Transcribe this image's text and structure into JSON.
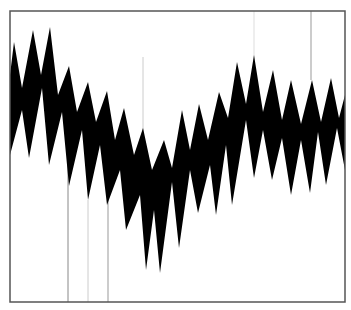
{
  "chart_data": {
    "type": "area",
    "title": "",
    "xlabel": "",
    "ylabel": "",
    "grid": false,
    "legend": null,
    "frame": {
      "x0": 10,
      "y0": 11,
      "x1": 345,
      "y1": 302,
      "color": "#555555"
    },
    "fill_color": "#000000",
    "upper_envelope": [
      [
        10,
        75
      ],
      [
        14,
        42
      ],
      [
        22,
        88
      ],
      [
        33,
        30
      ],
      [
        41,
        75
      ],
      [
        50,
        27
      ],
      [
        58,
        95
      ],
      [
        69,
        66
      ],
      [
        77,
        112
      ],
      [
        88,
        82
      ],
      [
        96,
        122
      ],
      [
        107,
        91
      ],
      [
        115,
        140
      ],
      [
        124,
        108
      ],
      [
        134,
        155
      ],
      [
        143,
        128
      ],
      [
        152,
        170
      ],
      [
        164,
        140
      ],
      [
        172,
        168
      ],
      [
        182,
        110
      ],
      [
        190,
        150
      ],
      [
        199,
        104
      ],
      [
        208,
        140
      ],
      [
        219,
        92
      ],
      [
        228,
        118
      ],
      [
        237,
        62
      ],
      [
        246,
        104
      ],
      [
        254,
        55
      ],
      [
        263,
        112
      ],
      [
        273,
        70
      ],
      [
        282,
        120
      ],
      [
        291,
        80
      ],
      [
        301,
        124
      ],
      [
        312,
        80
      ],
      [
        321,
        122
      ],
      [
        331,
        78
      ],
      [
        339,
        118
      ],
      [
        345,
        95
      ]
    ],
    "lower_envelope": [
      [
        345,
        170
      ],
      [
        337,
        128
      ],
      [
        326,
        185
      ],
      [
        318,
        132
      ],
      [
        310,
        193
      ],
      [
        301,
        140
      ],
      [
        291,
        195
      ],
      [
        282,
        138
      ],
      [
        272,
        180
      ],
      [
        263,
        130
      ],
      [
        254,
        178
      ],
      [
        246,
        120
      ],
      [
        232,
        205
      ],
      [
        226,
        145
      ],
      [
        216,
        215
      ],
      [
        210,
        165
      ],
      [
        198,
        213
      ],
      [
        190,
        170
      ],
      [
        179,
        248
      ],
      [
        172,
        182
      ],
      [
        160,
        273
      ],
      [
        154,
        210
      ],
      [
        146,
        270
      ],
      [
        140,
        195
      ],
      [
        126,
        230
      ],
      [
        120,
        170
      ],
      [
        107,
        205
      ],
      [
        100,
        145
      ],
      [
        88,
        200
      ],
      [
        82,
        130
      ],
      [
        69,
        186
      ],
      [
        62,
        112
      ],
      [
        49,
        165
      ],
      [
        42,
        88
      ],
      [
        29,
        158
      ],
      [
        22,
        110
      ],
      [
        10,
        155
      ]
    ],
    "vertical_lines": [
      {
        "x": 68,
        "y0": 150,
        "y1": 302,
        "color": "#888888"
      },
      {
        "x": 88,
        "y0": 200,
        "y1": 302,
        "color": "#cccccc"
      },
      {
        "x": 108,
        "y0": 200,
        "y1": 302,
        "color": "#999999"
      },
      {
        "x": 143,
        "y0": 57,
        "y1": 140,
        "color": "#cccccc"
      },
      {
        "x": 254,
        "y0": 11,
        "y1": 60,
        "color": "#dddddd"
      },
      {
        "x": 311,
        "y0": 11,
        "y1": 80,
        "color": "#999999"
      }
    ]
  }
}
